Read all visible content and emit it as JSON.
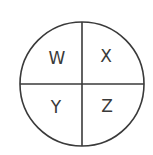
{
  "diagram": {
    "shape": "circle divided into four quadrants",
    "quadrants": [
      {
        "position": "top-left",
        "label": "W"
      },
      {
        "position": "top-right",
        "label": "X"
      },
      {
        "position": "bottom-left",
        "label": "Y"
      },
      {
        "position": "bottom-right",
        "label": "Z"
      }
    ],
    "colors": {
      "stroke": "#3a3a3a",
      "background": "#ffffff"
    }
  }
}
